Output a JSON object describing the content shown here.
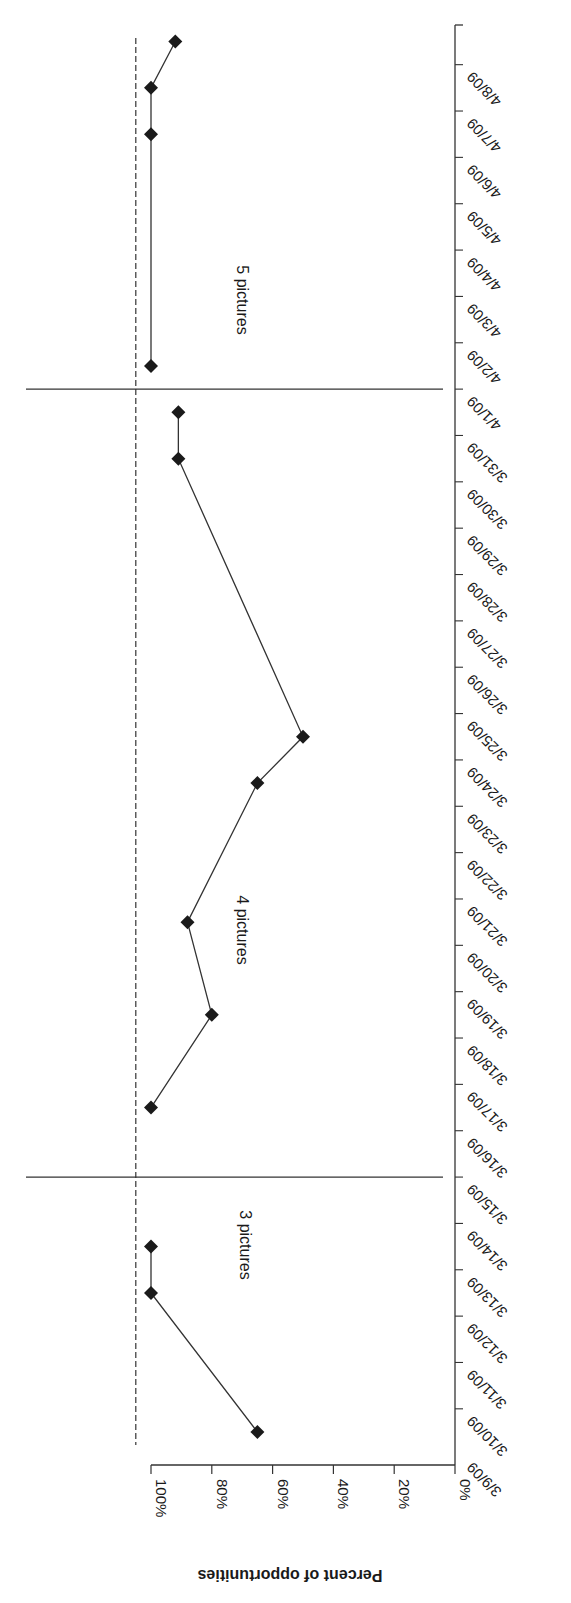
{
  "chart_data": {
    "type": "line",
    "orientation_note": "figure is printed rotated 180 degrees",
    "title": "",
    "xlabel": "",
    "ylabel": "Percent of opportunities",
    "ylim": [
      0,
      100
    ],
    "y_ticks": [
      "0%",
      "20%",
      "40%",
      "60%",
      "80%",
      "100%"
    ],
    "y_tick_values": [
      0,
      20,
      40,
      60,
      80,
      100
    ],
    "categories": [
      "3/9/09",
      "3/10/09",
      "3/11/09",
      "3/12/09",
      "3/13/09",
      "3/14/09",
      "3/15/09",
      "3/16/09",
      "3/17/09",
      "3/18/09",
      "3/19/09",
      "3/20/09",
      "3/21/09",
      "3/22/09",
      "3/23/09",
      "3/24/09",
      "3/25/09",
      "3/26/09",
      "3/27/09",
      "3/28/09",
      "3/29/09",
      "3/30/09",
      "3/31/09",
      "4/1/09",
      "4/2/09",
      "4/3/09",
      "4/4/09",
      "4/5/09",
      "4/6/09",
      "4/7/09",
      "4/8/09"
    ],
    "criterion_line": {
      "value": 105,
      "style": "dashed"
    },
    "phase_change_lines_after_index": [
      5.5,
      22.5
    ],
    "phases": [
      {
        "label": "3 pictures",
        "points": [
          {
            "index": 0,
            "date": "3/9/09",
            "value": 65
          },
          {
            "index": 3,
            "date": "3/12/09",
            "value": 100
          },
          {
            "index": 4,
            "date": "3/13/09",
            "value": 100
          }
        ]
      },
      {
        "label": "4 pictures",
        "points": [
          {
            "index": 7,
            "date": "3/16/09",
            "value": 100
          },
          {
            "index": 9,
            "date": "3/18/09",
            "value": 80
          },
          {
            "index": 11,
            "date": "3/20/09",
            "value": 88
          },
          {
            "index": 14,
            "date": "3/23/09",
            "value": 65
          },
          {
            "index": 15,
            "date": "3/24/09",
            "value": 50
          },
          {
            "index": 21,
            "date": "3/30/09",
            "value": 91
          },
          {
            "index": 22,
            "date": "3/31/09",
            "value": 91
          }
        ]
      },
      {
        "label": "5 pictures",
        "points": [
          {
            "index": 23,
            "date": "4/1/09",
            "value": 100
          },
          {
            "index": 28,
            "date": "4/6/09",
            "value": 100
          },
          {
            "index": 29,
            "date": "4/7/09",
            "value": 100
          },
          {
            "index": 30,
            "date": "4/8/09",
            "value": 92
          }
        ]
      }
    ],
    "marker": "diamond",
    "grid": false,
    "legend": null
  },
  "layout": {
    "value_zero_px": 455,
    "value_px_per_pct": 3.04,
    "cat_zero_px": 1432,
    "cat_px_per_step": 46.35,
    "axis_top_px": 25,
    "axis_bottom_px": 1465,
    "colors": {
      "ink": "#1a1a1a",
      "line": "#333333",
      "background": "#ffffff"
    }
  }
}
